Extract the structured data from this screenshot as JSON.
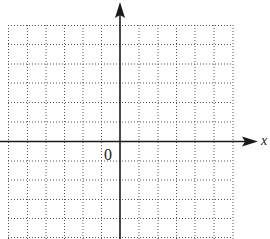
{
  "diagram": {
    "type": "coordinate-grid",
    "x_axis_label": "x",
    "origin_label": "0",
    "grid": {
      "columns_left_of_y_axis": 6,
      "columns_right_of_y_axis": 6,
      "rows_above_x_axis": 6,
      "rows_below_x_axis": 5,
      "line_style": "dotted"
    },
    "colors": {
      "axis": "#1a1a1a",
      "grid": "#555555",
      "background": "#ffffff"
    }
  }
}
